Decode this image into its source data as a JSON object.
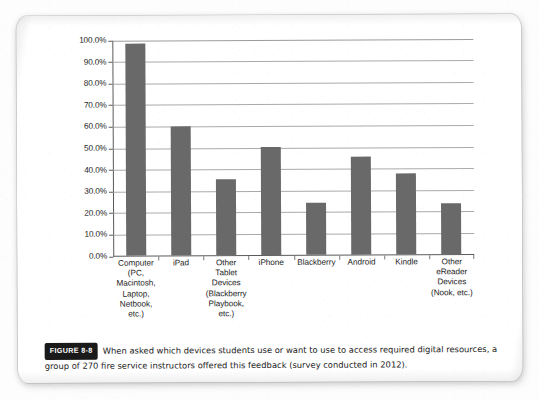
{
  "page": {
    "figure_label": "FIGURE 8-8",
    "caption": "When asked which devices students use or want to use to access required digital resources, a group of 270 fire service instructors offered this feedback (survey conducted in 2012)."
  },
  "colors": {
    "bar_fill": "#696969",
    "gridline": "#9b9b9b",
    "axis": "#5a5a5a",
    "text": "#1d1d1d",
    "badge_bg": "#1a1a1a",
    "badge_text": "#ffffff",
    "page": "#ffffff"
  },
  "chart_data": {
    "type": "bar",
    "title": "",
    "xlabel": "",
    "ylabel": "",
    "ylim": [
      0,
      100
    ],
    "ytick_step": 10,
    "grid": true,
    "legend": null,
    "value_suffix": "%",
    "ytick_labels": [
      "0.0%",
      "10.0%",
      "20.0%",
      "30.0%",
      "40.0%",
      "50.0%",
      "60.0%",
      "70.0%",
      "80.0%",
      "90.0%",
      "100.0%"
    ],
    "categories": [
      "Computer\n(PC,\nMacintosh,\nLaptop,\nNetbook,\netc.)",
      "iPad",
      "Other\nTablet\nDevices\n(Blackberry\nPlaybook,\netc.)",
      "iPhone",
      "Blackberry",
      "Android",
      "Kindle",
      "Other\neReader\nDevices\n(Nook, etc.)"
    ],
    "values": [
      98.0,
      59.5,
      35.0,
      50.0,
      24.0,
      45.5,
      37.5,
      23.5
    ]
  }
}
